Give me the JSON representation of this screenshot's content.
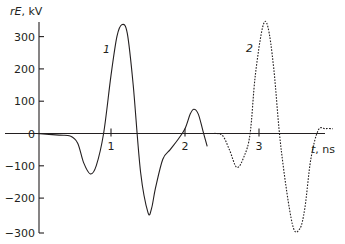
{
  "chart_data": {
    "type": "line",
    "title": "",
    "xlabel": "t, ns",
    "ylabel": "rE , kV",
    "ylim": [
      -300,
      340
    ],
    "xlim": [
      0,
      4.1
    ],
    "grid": false,
    "legend": "inline curve labels",
    "x_ticks": [
      "1",
      "2",
      "3"
    ],
    "y_ticks": [
      "300",
      "200",
      "100",
      "0",
      "−100",
      "−200",
      "−300"
    ],
    "series": [
      {
        "name": "1",
        "style": "solid",
        "x": [
          0.0,
          0.3,
          0.45,
          0.55,
          0.63,
          0.72,
          0.8,
          0.9,
          1.0,
          1.08,
          1.15,
          1.22,
          1.3,
          1.4,
          1.5,
          1.55,
          1.6,
          1.7,
          1.8,
          1.9,
          2.0,
          2.07,
          2.12,
          2.18,
          2.24,
          2.3
        ],
        "y": [
          0,
          -5,
          -8,
          -30,
          -90,
          -125,
          -100,
          0,
          180,
          300,
          337,
          310,
          150,
          -120,
          -245,
          -230,
          -170,
          -80,
          -50,
          -20,
          15,
          60,
          75,
          60,
          10,
          -40
        ]
      },
      {
        "name": "2",
        "style": "dotted",
        "x": [
          2.35,
          2.5,
          2.6,
          2.7,
          2.8,
          2.88,
          2.95,
          3.05,
          3.12,
          3.2,
          3.3,
          3.45,
          3.55,
          3.62,
          3.7,
          3.8,
          3.9,
          4.0
        ],
        "y": [
          0,
          -5,
          -50,
          -105,
          -70,
          0,
          180,
          330,
          330,
          200,
          -50,
          -280,
          -295,
          -230,
          -80,
          10,
          15,
          15
        ]
      }
    ]
  },
  "labels": {
    "y_title_var": "rE",
    "y_title_unit": ", kV",
    "x_title_var": "t",
    "x_title_unit": ", ns",
    "curve1": "1",
    "curve2": "2"
  }
}
